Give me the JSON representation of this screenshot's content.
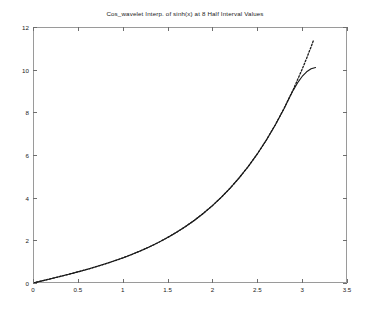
{
  "chart_data": {
    "type": "line",
    "title": "Cos_wavelet Interp. of sinh(x) at 8 Half Interval Values",
    "xlabel": "",
    "ylabel": "",
    "xlim": [
      0,
      3.5
    ],
    "ylim": [
      0,
      12
    ],
    "grid": false,
    "legend": null,
    "x_ticks": [
      "0",
      "0.5",
      "1",
      "1.5",
      "2",
      "2.5",
      "3",
      "3.5"
    ],
    "x_tick_values": [
      0,
      0.5,
      1,
      1.5,
      2,
      2.5,
      3,
      3.5
    ],
    "y_ticks": [
      "0",
      "2",
      "4",
      "6",
      "8",
      "10",
      "12"
    ],
    "y_tick_values": [
      0,
      2,
      4,
      6,
      8,
      10,
      12
    ],
    "series": [
      {
        "name": "sinh(x) reference",
        "style": "dotted",
        "color": "#1a1a1a",
        "x": [
          0.0,
          0.1,
          0.2,
          0.3,
          0.4,
          0.5,
          0.6,
          0.7,
          0.8,
          0.9,
          1.0,
          1.1,
          1.2,
          1.3,
          1.4,
          1.5,
          1.6,
          1.7,
          1.8,
          1.9,
          2.0,
          2.1,
          2.2,
          2.3,
          2.4,
          2.5,
          2.6,
          2.7,
          2.8,
          2.9,
          3.0,
          3.05,
          3.1,
          3.13
        ],
        "y": [
          0.0,
          0.1002,
          0.2013,
          0.3045,
          0.4108,
          0.5211,
          0.6367,
          0.7586,
          0.8881,
          1.0265,
          1.1752,
          1.3356,
          1.5095,
          1.6984,
          1.9043,
          2.1293,
          2.3756,
          2.6456,
          2.9422,
          3.2682,
          3.6269,
          4.0219,
          4.4571,
          4.937,
          5.4662,
          6.0502,
          6.6947,
          7.4063,
          8.1919,
          9.0596,
          10.0179,
          10.5335,
          11.0765,
          11.4137
        ]
      },
      {
        "name": "Cos_wavelet interpolation",
        "style": "solid",
        "color": "#1a1a1a",
        "x": [
          0.0,
          0.1,
          0.2,
          0.3,
          0.4,
          0.5,
          0.6,
          0.7,
          0.8,
          0.9,
          1.0,
          1.1,
          1.2,
          1.3,
          1.4,
          1.5,
          1.6,
          1.7,
          1.8,
          1.9,
          2.0,
          2.1,
          2.2,
          2.3,
          2.4,
          2.5,
          2.6,
          2.7,
          2.8,
          2.85,
          2.9,
          2.95,
          3.0,
          3.05,
          3.1,
          3.15
        ],
        "y": [
          0.0,
          0.1002,
          0.2013,
          0.3045,
          0.4108,
          0.5211,
          0.6367,
          0.7586,
          0.8881,
          1.0265,
          1.1752,
          1.3356,
          1.5095,
          1.6984,
          1.9043,
          2.1293,
          2.3756,
          2.6456,
          2.9422,
          3.2682,
          3.6269,
          4.0219,
          4.4571,
          4.937,
          5.4662,
          6.0502,
          6.6947,
          7.4063,
          8.1919,
          8.62,
          9.03,
          9.39,
          9.68,
          9.9,
          10.04,
          10.1
        ]
      }
    ],
    "annotations": []
  },
  "bottom_caption": {
    "text": ""
  }
}
